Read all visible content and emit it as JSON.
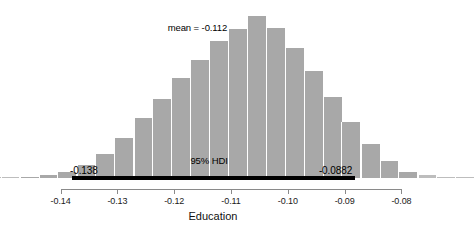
{
  "chart_data": {
    "type": "bar",
    "title": "",
    "subtitle": "",
    "xlabel": "Education",
    "ylabel": "",
    "grid": false,
    "legend": "none",
    "xlim": [
      -0.1475,
      -0.0785
    ],
    "ylim": [
      0,
      1.0
    ],
    "bar_color": "#a8a8a8",
    "bar_edge_color": "#ffffff",
    "axis_color": "#8a8a8a",
    "hdi_color": "#000000",
    "tick_values": [
      -0.14,
      -0.13,
      -0.12,
      -0.11,
      -0.1,
      -0.09,
      -0.08
    ],
    "tick_labels": [
      "-0.14",
      "-0.13",
      "-0.12",
      "-0.11",
      "-0.10",
      "-0.09",
      "-0.08"
    ],
    "bin_width": 0.00333,
    "categories": [
      -0.1455,
      -0.1422,
      -0.1389,
      -0.1355,
      -0.1322,
      -0.1289,
      -0.1255,
      -0.1222,
      -0.1189,
      -0.1155,
      -0.1122,
      -0.1089,
      -0.1055,
      -0.1022,
      -0.0989,
      -0.0955,
      -0.0922,
      -0.0889,
      -0.0855,
      -0.0822,
      -0.0789
    ],
    "values": [
      0.006,
      0.016,
      0.034,
      0.078,
      0.148,
      0.25,
      0.368,
      0.49,
      0.62,
      0.73,
      0.845,
      0.92,
      1.0,
      0.925,
      0.8,
      0.66,
      0.5,
      0.345,
      0.21,
      0.105,
      0.04
    ],
    "tail_left": {
      "categories": [
        -0.1555,
        -0.1522,
        -0.1489
      ],
      "values": [
        0.002,
        0.004,
        0.006
      ]
    },
    "tail_right": {
      "categories": [
        -0.0755,
        -0.0722,
        -0.0689
      ],
      "values": [
        0.018,
        0.008,
        0.003
      ]
    },
    "annotations": {
      "mean_label": "mean = -0.112",
      "mean_value": -0.112,
      "hdi_label": "95% HDI",
      "hdi_low_label": "-0.138",
      "hdi_high_label": "-0.0882",
      "hdi_low_value": -0.138,
      "hdi_high_value": -0.0882,
      "hdi_level": "95%"
    }
  }
}
